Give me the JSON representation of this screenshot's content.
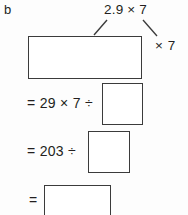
{
  "page": {
    "part_label": "b",
    "background_color": "#fdfdfd",
    "ink_color": "#231f20",
    "box_border_color": "#3b3b3b"
  },
  "annotations": [
    {
      "name": "expression-callout",
      "text": "2.9 × 7",
      "points_to": [
        "top-answer-box",
        "multiplier-callout"
      ]
    },
    {
      "name": "multiplier-callout",
      "text": "× 7"
    }
  ],
  "worked_solution": {
    "lines": [
      {
        "id": "line-0",
        "text": "",
        "answer_box": "empty",
        "box_shape": "wide-rectangle"
      },
      {
        "id": "line-1",
        "text": "= 29 × 7 ÷",
        "answer_box": "empty",
        "box_shape": "square"
      },
      {
        "id": "line-2",
        "text": "= 203 ÷",
        "answer_box": "empty",
        "box_shape": "square"
      },
      {
        "id": "line-3",
        "text": "=",
        "answer_box": "empty",
        "box_shape": "rectangle"
      }
    ]
  }
}
